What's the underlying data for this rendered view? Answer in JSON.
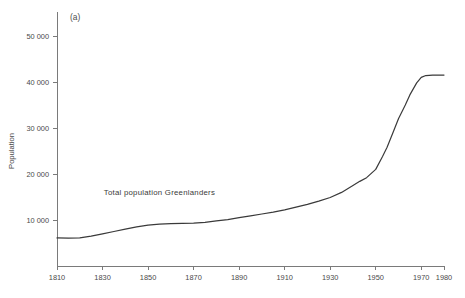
{
  "figure": {
    "panel_label": "(a)",
    "background_color": "#ffffff",
    "line_color": "#3a3a3a",
    "axis_color": "#7a7a7a"
  },
  "chart_data": {
    "type": "line",
    "title": "",
    "subtitle": "",
    "xlabel": "",
    "ylabel": "Population",
    "xlim": [
      1810,
      1980
    ],
    "ylim": [
      0,
      54000
    ],
    "grid": false,
    "legend_position": "none",
    "xticks": [
      1810,
      1830,
      1850,
      1870,
      1890,
      1910,
      1930,
      1950,
      1970,
      1980
    ],
    "xtick_labels": [
      "1810",
      "1830",
      "1850",
      "1870",
      "1890",
      "1910",
      "1930",
      "1950",
      "1970",
      "1980"
    ],
    "yticks": [
      10000,
      20000,
      30000,
      40000,
      50000
    ],
    "ytick_labels": [
      "10 000",
      "20 000",
      "30 000",
      "40 000",
      "50 000"
    ],
    "annotations": [
      {
        "text": "Total population Greenlanders",
        "x": 1855,
        "y": 15500
      }
    ],
    "series": [
      {
        "name": "Total population Greenlanders",
        "x": [
          1810,
          1815,
          1820,
          1825,
          1830,
          1835,
          1840,
          1845,
          1850,
          1855,
          1860,
          1865,
          1870,
          1875,
          1880,
          1885,
          1890,
          1895,
          1900,
          1905,
          1910,
          1915,
          1920,
          1925,
          1930,
          1935,
          1940,
          1943,
          1946,
          1950,
          1953,
          1955,
          1958,
          1960,
          1963,
          1965,
          1968,
          1970,
          1972,
          1975,
          1978,
          1980
        ],
        "values": [
          6100,
          6050,
          6100,
          6500,
          7000,
          7500,
          8000,
          8500,
          8900,
          9100,
          9200,
          9250,
          9300,
          9500,
          9800,
          10100,
          10500,
          10900,
          11300,
          11700,
          12200,
          12800,
          13400,
          14100,
          14900,
          16000,
          17500,
          18400,
          19200,
          21000,
          23800,
          25800,
          29500,
          32000,
          35000,
          37200,
          39800,
          41000,
          41400,
          41500,
          41500,
          41500
        ]
      }
    ]
  }
}
